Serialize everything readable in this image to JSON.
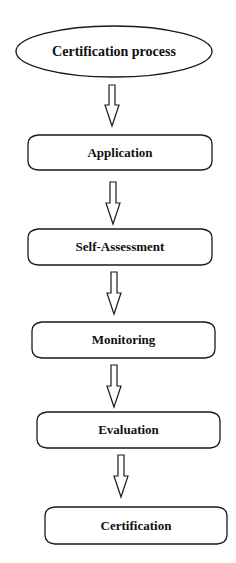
{
  "diagram": {
    "type": "flowchart",
    "direction": "top-to-bottom",
    "start": {
      "label": "Certification process",
      "shape": "ellipse"
    },
    "steps": [
      {
        "label": "Application",
        "shape": "rounded-rectangle"
      },
      {
        "label": "Self-Assessment",
        "shape": "rounded-rectangle"
      },
      {
        "label": "Monitoring",
        "shape": "rounded-rectangle"
      },
      {
        "label": "Evaluation",
        "shape": "rounded-rectangle"
      },
      {
        "label": "Certification",
        "shape": "rounded-rectangle"
      }
    ],
    "edges": [
      {
        "from": "Certification process",
        "to": "Application",
        "style": "hollow-block-arrow"
      },
      {
        "from": "Application",
        "to": "Self-Assessment",
        "style": "hollow-block-arrow"
      },
      {
        "from": "Self-Assessment",
        "to": "Monitoring",
        "style": "hollow-block-arrow"
      },
      {
        "from": "Monitoring",
        "to": "Evaluation",
        "style": "hollow-block-arrow"
      },
      {
        "from": "Evaluation",
        "to": "Certification",
        "style": "hollow-block-arrow"
      }
    ],
    "colors": {
      "stroke": "#1a1a1a",
      "fill": "#ffffff",
      "text": "#111111",
      "background": "#ffffff"
    }
  }
}
